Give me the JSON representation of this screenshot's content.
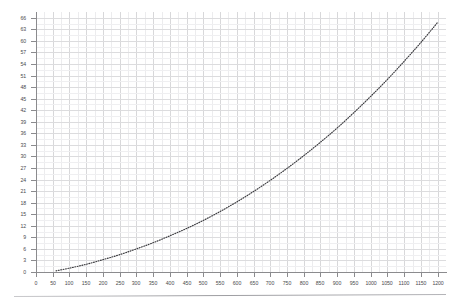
{
  "chart_data": {
    "type": "line",
    "title": "",
    "subtitle": "",
    "xlabel": "",
    "ylabel": "",
    "xlim": [
      0,
      1225
    ],
    "ylim": [
      0,
      67.5
    ],
    "grid": true,
    "legend": null,
    "legend_position": "none",
    "line_style": "dotted",
    "line_color": "#3b3b3f",
    "marker": "none",
    "x_ticks": [
      0,
      50,
      100,
      150,
      200,
      250,
      300,
      350,
      400,
      450,
      500,
      550,
      600,
      650,
      700,
      750,
      800,
      850,
      900,
      950,
      1000,
      1050,
      1100,
      1150,
      1200
    ],
    "x_tick_labels": [
      "0",
      "50",
      "100",
      "150",
      "200",
      "250",
      "300",
      "350",
      "400",
      "450",
      "500",
      "550",
      "600",
      "650",
      "700",
      "750",
      "800",
      "850",
      "900",
      "950",
      "1000",
      "1050",
      "1100",
      "1150",
      "1200"
    ],
    "y_ticks": [
      0,
      3,
      6,
      9,
      12,
      15,
      18,
      21,
      24,
      27,
      30,
      33,
      36,
      39,
      42,
      45,
      48,
      51,
      54,
      57,
      60,
      63,
      66
    ],
    "y_tick_labels": [
      "0",
      "3",
      "6",
      "9",
      "12",
      "15",
      "18",
      "21",
      "24",
      "27",
      "30",
      "33",
      "36",
      "39",
      "42",
      "45",
      "48",
      "51",
      "54",
      "57",
      "60",
      "63",
      "66"
    ],
    "x": [
      60,
      100,
      150,
      200,
      250,
      300,
      350,
      400,
      450,
      500,
      550,
      600,
      650,
      700,
      750,
      800,
      850,
      900,
      950,
      1000,
      1050,
      1100,
      1150,
      1200
    ],
    "values": [
      0.3,
      1.0,
      2.0,
      3.2,
      4.5,
      6.0,
      7.6,
      9.4,
      11.3,
      13.4,
      15.7,
      18.2,
      20.9,
      23.8,
      26.9,
      30.2,
      33.7,
      37.4,
      41.4,
      45.6,
      50.0,
      54.7,
      59.6,
      64.8
    ],
    "series": [
      {
        "name": "curve",
        "x": [
          60,
          100,
          150,
          200,
          250,
          300,
          350,
          400,
          450,
          500,
          550,
          600,
          650,
          700,
          750,
          800,
          850,
          900,
          950,
          1000,
          1050,
          1100,
          1150,
          1200
        ],
        "values": [
          0.3,
          1.0,
          2.0,
          3.2,
          4.5,
          6.0,
          7.6,
          9.4,
          11.3,
          13.4,
          15.7,
          18.2,
          20.9,
          23.8,
          26.9,
          30.2,
          33.7,
          37.4,
          41.4,
          45.6,
          50.0,
          54.7,
          59.6,
          64.8
        ]
      }
    ],
    "annotations": []
  },
  "figure": {
    "background_color": "#ffffff",
    "grid_color": "#dcdcde",
    "axis_color": "#8b8b8e",
    "tick_label_color": "#4a4a4d",
    "footer_rule": true
  }
}
